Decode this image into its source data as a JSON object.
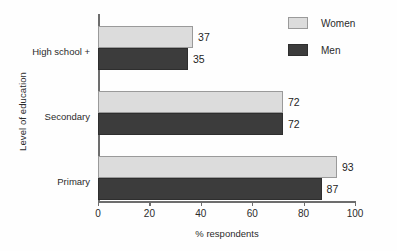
{
  "chart_data": {
    "type": "bar",
    "orientation": "horizontal",
    "title": "",
    "xlabel": "% respondents",
    "ylabel": "Level of education",
    "xlim": [
      0,
      100
    ],
    "xticks": [
      0,
      20,
      40,
      60,
      80,
      100
    ],
    "xtick_labels": [
      "0",
      "20",
      "40",
      "60",
      "80",
      "100"
    ],
    "grid": false,
    "legend_position": "top-right",
    "categories": [
      "High school +",
      "Secondary",
      "Primary"
    ],
    "series": [
      {
        "name": "Women",
        "color": "#dcdcdc",
        "values": [
          37,
          72,
          93
        ],
        "value_labels": [
          "37",
          "72",
          "93"
        ]
      },
      {
        "name": "Men",
        "color": "#3c3c3c",
        "values": [
          35,
          72,
          87
        ],
        "value_labels": [
          "35",
          "72",
          "87"
        ]
      }
    ]
  },
  "legend": {
    "items": [
      {
        "label": "Women",
        "swatch": "women"
      },
      {
        "label": "Men",
        "swatch": "men"
      }
    ]
  },
  "axes": {
    "x_title": "% respondents",
    "y_title": "Level of education"
  }
}
